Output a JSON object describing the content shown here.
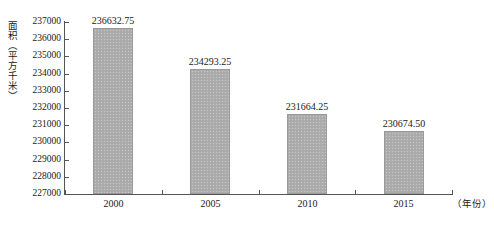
{
  "chart_data": {
    "type": "bar",
    "title": "",
    "subtitle": "",
    "xlabel": "（年份）",
    "ylabel": "面积（平方千米）",
    "categories": [
      "2000",
      "2005",
      "2010",
      "2015"
    ],
    "values": [
      236632.75,
      234293.25,
      231664.25,
      230674.5
    ],
    "value_labels": [
      "236632.75",
      "234293.25",
      "231664.25",
      "230674.50"
    ],
    "ylim": [
      227000,
      237000
    ],
    "ytick_step": 1000,
    "ytick_labels": [
      "237000",
      "236000",
      "235000",
      "234000",
      "233000",
      "232000",
      "231000",
      "230000",
      "229000",
      "228000",
      "227000"
    ],
    "ytick_values": [
      237000,
      236000,
      235000,
      234000,
      233000,
      232000,
      231000,
      230000,
      229000,
      228000,
      227000
    ],
    "grid": false,
    "legend": false,
    "legend_position": "none",
    "series": [
      {
        "name": "面积",
        "values": [
          236632.75,
          234293.25,
          231664.25,
          230674.5
        ]
      }
    ],
    "colors": {
      "bar_fill": "#adadad",
      "bar_border": "#9a9a9a",
      "axis": "#555555",
      "text": "#1a1a1a",
      "background": "#ffffff"
    }
  }
}
